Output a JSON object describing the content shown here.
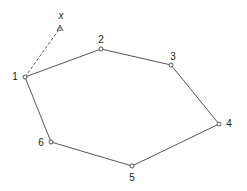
{
  "diagram": {
    "type": "polygon-with-vertices",
    "stroke_color": "#555555",
    "vertices": [
      {
        "id": "1",
        "label": "1",
        "x": 25,
        "y": 77,
        "label_x": 15,
        "label_y": 77
      },
      {
        "id": "2",
        "label": "2",
        "x": 101,
        "y": 49,
        "label_x": 101,
        "label_y": 40
      },
      {
        "id": "3",
        "label": "3",
        "x": 171,
        "y": 65,
        "label_x": 173,
        "label_y": 57
      },
      {
        "id": "4",
        "label": "4",
        "x": 219,
        "y": 124,
        "label_x": 229,
        "label_y": 124
      },
      {
        "id": "5",
        "label": "5",
        "x": 132,
        "y": 166,
        "label_x": 132,
        "label_y": 178
      },
      {
        "id": "6",
        "label": "6",
        "x": 51,
        "y": 142,
        "label_x": 41,
        "label_y": 143
      }
    ],
    "extra_point": {
      "label": "x",
      "x": 60,
      "y": 27,
      "label_x": 61,
      "label_y": 16
    },
    "dashed_edge": {
      "from": "1",
      "to": "x"
    }
  }
}
